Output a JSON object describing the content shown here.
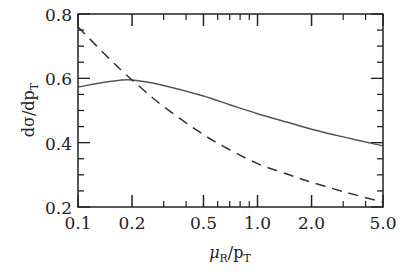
{
  "chart_data": {
    "type": "line",
    "title": "",
    "xlabel": "μR/pT",
    "ylabel": "dσ/dpT",
    "xscale": "log",
    "xlim": [
      0.1,
      5.0
    ],
    "ylim": [
      0.2,
      0.8
    ],
    "grid": false,
    "legend": null,
    "x_ticks": [
      "0.1",
      "0.2",
      "0.5",
      "1.0",
      "2.0",
      "5.0"
    ],
    "y_ticks": [
      "0.2",
      "0.4",
      "0.6",
      "0.8"
    ],
    "x": [
      0.1,
      0.15,
      0.2,
      0.3,
      0.5,
      0.7,
      1.0,
      1.5,
      2.0,
      3.0,
      5.0
    ],
    "series": [
      {
        "name": "solid",
        "style": "solid",
        "color": "#555555",
        "values": [
          0.573,
          0.59,
          0.595,
          0.578,
          0.545,
          0.518,
          0.49,
          0.462,
          0.442,
          0.418,
          0.39
        ]
      },
      {
        "name": "dashed",
        "style": "dashed",
        "color": "#333333",
        "values": [
          0.76,
          0.66,
          0.595,
          0.512,
          0.425,
          0.378,
          0.335,
          0.3,
          0.277,
          0.248,
          0.215
        ]
      }
    ]
  },
  "labels": {
    "ylabel_main": "dσ/dp",
    "ylabel_sub": "T",
    "xlabel_mu": "μ",
    "xlabel_mu_sub": "R",
    "xlabel_rest": "/p",
    "xlabel_rest_sub": "T"
  }
}
